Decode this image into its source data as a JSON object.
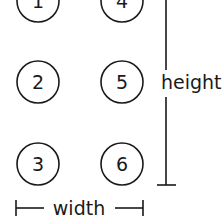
{
  "diagram": {
    "columns": [
      {
        "items": [
          "1",
          "2",
          "3"
        ]
      },
      {
        "items": [
          "4",
          "5",
          "6"
        ]
      }
    ],
    "labels": {
      "height": "height",
      "width": "width"
    },
    "colors": {
      "stroke": "#1a1a1a",
      "background": "#ffffff"
    }
  }
}
